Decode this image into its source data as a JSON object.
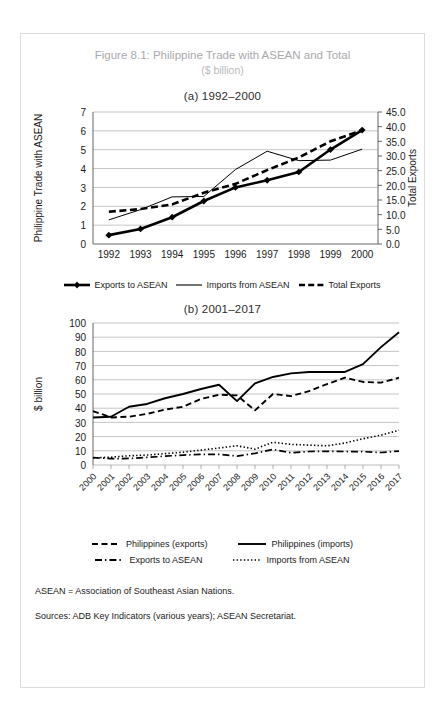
{
  "figure": {
    "title": "Figure 8.1: Philippine Trade with ASEAN and Total",
    "subtitle": "($ billion)",
    "panel_a_title": "(a) 1992–2000",
    "panel_b_title": "(b) 2001–2017",
    "note": "ASEAN = Association of Southeast Asian Nations.",
    "sources": "Sources: ADB Key Indicators (various years); ASEAN Secretariat.",
    "title_color": "#a9a9ad",
    "line_color": "#000000"
  },
  "legend_a": {
    "item1": "Exports to ASEAN",
    "item2": "Imports from ASEAN",
    "item3": "Total Exports"
  },
  "legend_b": {
    "item1": "Philippines (exports)",
    "item2": "Philippines (imports)",
    "item3": "Exports to ASEAN",
    "item4": "Imports from ASEAN"
  },
  "chart_data": [
    {
      "type": "line",
      "title": "(a) 1992–2000",
      "xlabel": "",
      "ylabel": "Philippine Trade with ASEAN",
      "y2label": "Total Exports",
      "categories": [
        "1992",
        "1993",
        "1994",
        "1995",
        "1996",
        "1997",
        "1998",
        "1999",
        "2000"
      ],
      "ylim": [
        0,
        7
      ],
      "yticks": [
        0,
        1,
        2,
        3,
        4,
        5,
        6,
        7
      ],
      "y2lim": [
        0,
        45
      ],
      "y2ticks": [
        "0.0",
        "5.0",
        "10.0",
        "15.0",
        "20.0",
        "25.0",
        "30.0",
        "35.0",
        "40.0",
        "45.0"
      ],
      "grid": true,
      "legend_position": "bottom",
      "series": [
        {
          "name": "Exports to ASEAN",
          "axis": "left",
          "style": "solid-thick-marker",
          "values": [
            0.47,
            0.8,
            1.42,
            2.28,
            3.0,
            3.38,
            3.82,
            5.01,
            6.04
          ]
        },
        {
          "name": "Imports from ASEAN",
          "axis": "left",
          "style": "solid-thin",
          "values": [
            1.28,
            1.82,
            2.5,
            2.52,
            3.95,
            4.92,
            4.42,
            4.45,
            5.03
          ]
        },
        {
          "name": "Total Exports",
          "axis": "right",
          "style": "dashed-thick",
          "values": [
            11.0,
            11.9,
            13.5,
            17.5,
            20.5,
            25.2,
            29.5,
            35.0,
            38.8
          ]
        }
      ]
    },
    {
      "type": "line",
      "title": "(b) 2001–2017",
      "xlabel": "",
      "ylabel": "$ billion",
      "categories": [
        "2000",
        "2001",
        "2002",
        "2003",
        "2004",
        "2005",
        "2006",
        "2007",
        "2008",
        "2009",
        "2010",
        "2011",
        "2012",
        "2013",
        "2014",
        "2015",
        "2016",
        "2017"
      ],
      "ylim": [
        0,
        100
      ],
      "yticks": [
        0,
        10,
        20,
        30,
        40,
        50,
        60,
        70,
        80,
        90,
        100
      ],
      "grid": true,
      "legend_position": "bottom",
      "series": [
        {
          "name": "Philippines (exports)",
          "style": "dashed",
          "values": [
            38.0,
            33.5,
            34.0,
            36.0,
            39.0,
            41.0,
            46.5,
            49.5,
            49.0,
            38.5,
            50.0,
            48.5,
            52.0,
            57.0,
            61.5,
            58.5,
            58.0,
            61.5
          ]
        },
        {
          "name": "Philippines (imports)",
          "style": "solid",
          "values": [
            33.5,
            34.0,
            41.0,
            43.0,
            47.0,
            50.0,
            53.5,
            56.5,
            45.0,
            57.5,
            62.0,
            64.5,
            65.5,
            65.5,
            65.5,
            71.0,
            83.0,
            93.5
          ]
        },
        {
          "name": "Exports to ASEAN",
          "style": "dash-dot",
          "values": [
            5.2,
            4.5,
            4.6,
            5.3,
            6.2,
            7.0,
            7.5,
            7.5,
            6.3,
            8.2,
            11.0,
            8.6,
            9.5,
            9.6,
            9.5,
            9.4,
            8.8,
            9.8
          ]
        },
        {
          "name": "Imports from ASEAN",
          "style": "dotted",
          "values": [
            5.0,
            5.5,
            6.5,
            7.0,
            8.0,
            9.0,
            10.5,
            12.0,
            13.5,
            11.2,
            16.0,
            14.5,
            14.0,
            13.5,
            15.5,
            18.5,
            21.0,
            24.5
          ]
        }
      ]
    }
  ]
}
